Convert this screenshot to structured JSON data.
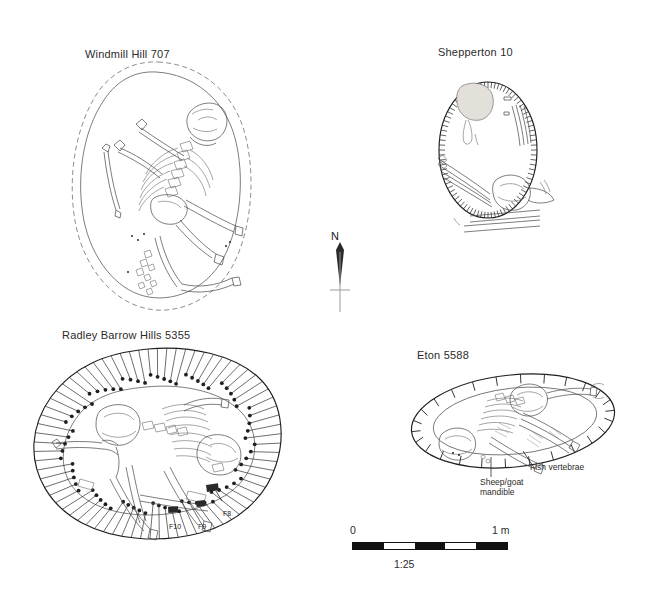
{
  "figure": {
    "caption_scale": "1:25",
    "background": "#ffffff",
    "ink": "#1f1f1f"
  },
  "north_arrow": {
    "label": "N",
    "icon": "north-arrow-icon"
  },
  "scale_bar": {
    "min_label": "0",
    "max_label": "1 m",
    "ratio_label": "1:25",
    "segments": [
      "on",
      "off",
      "on",
      "off",
      "on"
    ],
    "segment_count": 5
  },
  "plans": [
    {
      "id": "windmill-hill-707",
      "title": "Windmill Hill 707",
      "outline_style": "dashed outer edge with solid inner grave cut",
      "annotations": []
    },
    {
      "id": "shepperton-10",
      "title": "Shepperton 10",
      "outline_style": "oval with dense fine hachure ticks",
      "annotations": []
    },
    {
      "id": "radley-barrow-hills-5355",
      "title": "Radley Barrow Hills 5355",
      "outline_style": "large ovoid with radiating tadpole hachures",
      "annotations": [
        {
          "id": "f8",
          "label": "F8"
        },
        {
          "id": "f10",
          "label": "F10"
        },
        {
          "id": "f9",
          "label": "F9"
        }
      ]
    },
    {
      "id": "eton-5588",
      "title": "Eton 5588",
      "outline_style": "elongated ellipse with sparse hachure ticks",
      "annotations": [
        {
          "id": "fish-vertebrae",
          "label": "Fish vertebrae"
        },
        {
          "id": "sheep-goat-mandible",
          "label": "Sheep/goat\nmandible"
        }
      ]
    }
  ]
}
